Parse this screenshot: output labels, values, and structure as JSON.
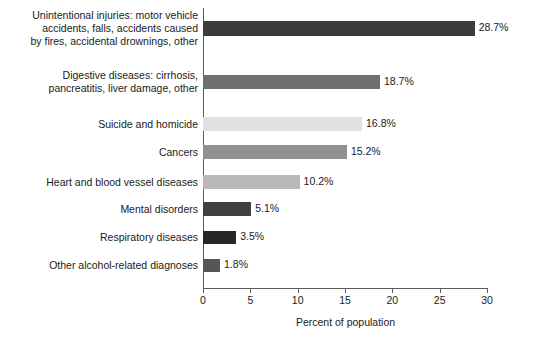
{
  "chart_data": {
    "type": "bar",
    "orientation": "horizontal",
    "title": "",
    "subtitle": "",
    "xlabel": "Percent of population",
    "ylabel": "",
    "xlim": [
      0,
      30
    ],
    "xticks": [
      0,
      5,
      10,
      15,
      20,
      25,
      30
    ],
    "xtick_labels": [
      "0",
      "5",
      "10",
      "15",
      "20",
      "25",
      "30"
    ],
    "grid": false,
    "legend": null,
    "value_label_suffix": "%",
    "categories": [
      "Unintentional injuries: motor vehicle accidents, falls, accidents caused by fires, accidental drownings, other",
      "Digestive diseases: cirrhosis, pancreatitis, liver damage, other",
      "Suicide and homicide",
      "Cancers",
      "Heart and blood vessel diseases",
      "Mental disorders",
      "Respiratory diseases",
      "Other alcohol-related diagnoses"
    ],
    "values": [
      28.7,
      18.7,
      16.8,
      15.2,
      10.2,
      5.1,
      3.5,
      1.8
    ],
    "value_labels": [
      "28.7%",
      "18.7%",
      "16.8%",
      "15.2%",
      "10.2%",
      "5.1%",
      "3.5%",
      "1.8%"
    ],
    "bar_colors": [
      "#3c3c3c",
      "#6f6f6f",
      "#e1e1e1",
      "#919191",
      "#b9b9b9",
      "#414141",
      "#272727",
      "#565656"
    ]
  },
  "axis": {
    "line_color": "#5a5a5a"
  },
  "rows": [
    {
      "label_lines": [
        "Unintentional injuries: motor vehicle",
        "accidents, falls, accidents caused",
        "by fires, accidental drownings, other"
      ],
      "value_label": "28.7%",
      "value": 28.7,
      "color": "#3c3c3c"
    },
    {
      "label_lines": [
        "Digestive diseases: cirrhosis,",
        "pancreatitis, liver damage, other"
      ],
      "value_label": "18.7%",
      "value": 18.7,
      "color": "#6f6f6f"
    },
    {
      "label_lines": [
        "Suicide and homicide"
      ],
      "value_label": "16.8%",
      "value": 16.8,
      "color": "#e1e1e1"
    },
    {
      "label_lines": [
        "Cancers"
      ],
      "value_label": "15.2%",
      "value": 15.2,
      "color": "#919191"
    },
    {
      "label_lines": [
        "Heart and blood vessel diseases"
      ],
      "value_label": "10.2%",
      "value": 10.2,
      "color": "#b9b9b9"
    },
    {
      "label_lines": [
        "Mental disorders"
      ],
      "value_label": "5.1%",
      "value": 5.1,
      "color": "#414141"
    },
    {
      "label_lines": [
        "Respiratory diseases"
      ],
      "value_label": "3.5%",
      "value": 3.5,
      "color": "#272727"
    },
    {
      "label_lines": [
        "Other alcohol-related diagnoses"
      ],
      "value_label": "1.8%",
      "value": 1.8,
      "color": "#565656"
    }
  ],
  "layout": {
    "row_centers": [
      28,
      82,
      124,
      152,
      182,
      209,
      237,
      265
    ],
    "bar_heights": [
      15,
      14,
      14,
      14,
      14,
      14,
      13,
      13
    ]
  }
}
